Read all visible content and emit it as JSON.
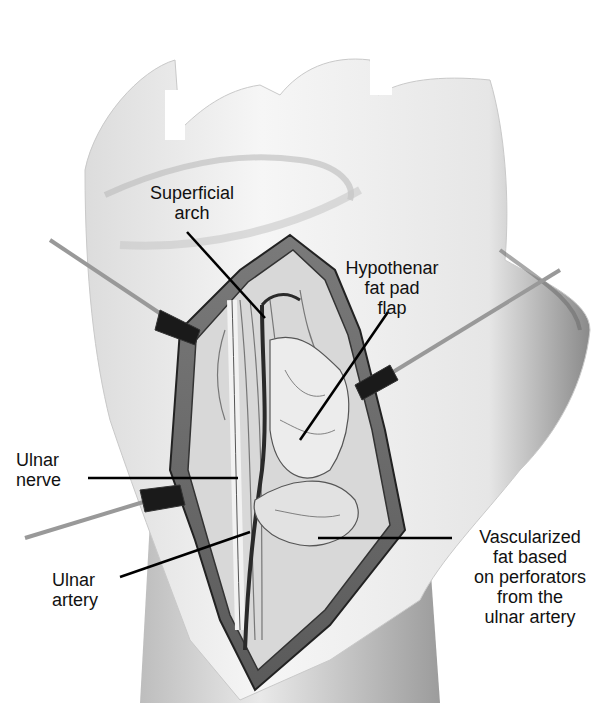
{
  "figure": {
    "colors": {
      "background": "#ffffff",
      "line": "#111111",
      "skin_shade": "#9a9a9a",
      "tissue_dark": "#2a2a2a"
    }
  },
  "labels": [
    {
      "id": "superficial-arch",
      "text": "Superficial\narch"
    },
    {
      "id": "hypothenar-fat-pad-flap",
      "text": "Hypothenar\nfat pad\nflap"
    },
    {
      "id": "ulnar-nerve",
      "text": "Ulnar\nnerve"
    },
    {
      "id": "ulnar-artery",
      "text": "Ulnar\nartery"
    },
    {
      "id": "vascularized-fat",
      "text": "Vascularized\nfat based\non perforators\nfrom the\nulnar artery"
    }
  ]
}
